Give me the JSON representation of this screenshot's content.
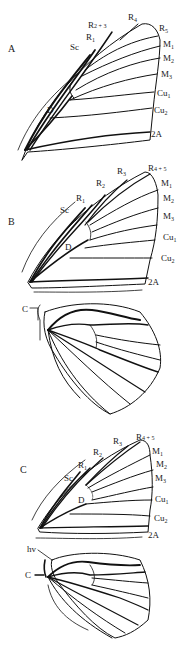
{
  "figure": {
    "panels": [
      {
        "id": "A",
        "letter": "A",
        "forewing_labels": {
          "sc": "Sc",
          "r1": [
            "R",
            "1"
          ],
          "r23": [
            "R",
            "2 + 3"
          ],
          "r4": [
            "R",
            "4"
          ],
          "r5": [
            "R",
            "5"
          ],
          "m1": [
            "M",
            "1"
          ],
          "m2": [
            "M",
            "2"
          ],
          "m3": [
            "M",
            "3"
          ],
          "cu1": [
            "Cu",
            "1"
          ],
          "cu2": [
            "Cu",
            "2"
          ],
          "a2": "2A",
          "d": "D"
        }
      },
      {
        "id": "B",
        "letter": "B",
        "forewing_labels": {
          "sc": "Sc",
          "r1": [
            "R",
            "1"
          ],
          "r2": [
            "R",
            "2"
          ],
          "r3": [
            "R",
            "3"
          ],
          "r45": [
            "R",
            "4 + 5"
          ],
          "m1": [
            "M",
            "1"
          ],
          "m2": [
            "M",
            "2"
          ],
          "m3": [
            "M",
            "3"
          ],
          "cu1": [
            "Cu",
            "1"
          ],
          "cu2": [
            "Cu",
            "2"
          ],
          "a2": "2A",
          "d": "D"
        },
        "hindwing_labels": {
          "c": "C"
        }
      },
      {
        "id": "C",
        "letter": "C",
        "forewing_labels": {
          "sc": "Sc",
          "r1": [
            "R",
            "1"
          ],
          "r2": [
            "R",
            "2"
          ],
          "r3": [
            "R",
            "3"
          ],
          "r45": [
            "R",
            "4 + 5"
          ],
          "m1": [
            "M",
            "1"
          ],
          "m2": [
            "M",
            "2"
          ],
          "m3": [
            "M",
            "3"
          ],
          "cu1": [
            "Cu",
            "1"
          ],
          "cu2": [
            "Cu",
            "2"
          ],
          "a2": "2A",
          "d": "D"
        },
        "hindwing_labels": {
          "hv": "hv",
          "c": "C"
        }
      }
    ]
  }
}
